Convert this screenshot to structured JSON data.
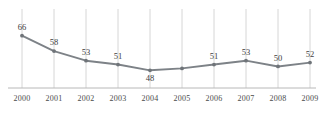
{
  "chart_data": {
    "type": "line",
    "title": "",
    "subtitle": "",
    "xlabel": "",
    "ylabel": "",
    "grid": "vertical",
    "legend": "none",
    "categories": [
      "2000",
      "2001",
      "2002",
      "2003",
      "2004",
      "2005",
      "2006",
      "2007",
      "2008",
      "2009"
    ],
    "values": [
      66,
      58,
      53,
      51,
      48,
      49,
      51,
      53,
      50,
      52
    ],
    "point_labels": [
      "66",
      "58",
      "53",
      "51",
      "48",
      "",
      "51",
      "53",
      "50",
      "52"
    ],
    "label_positions": [
      "above",
      "above",
      "above",
      "above",
      "below",
      "none",
      "above",
      "above",
      "above",
      "above"
    ],
    "ylim": [
      44,
      70
    ],
    "xlim": [
      "2000",
      "2009"
    ],
    "series": [
      {
        "name": "series-1",
        "values": [
          66,
          58,
          53,
          51,
          48,
          49,
          51,
          53,
          50,
          52
        ]
      }
    ],
    "annotations": []
  },
  "style": {
    "line_color": "#7d8287",
    "marker_color": "#6f7479",
    "gridline_color": "#d6d6d6",
    "axis_color": "#b8b8b8",
    "tick_text_color": "#4a4a4a",
    "value_text_color": "#3d3d3d",
    "background": "#ffffff"
  },
  "axis": {
    "tick_labels": [
      "2000",
      "2001",
      "2002",
      "2003",
      "2004",
      "2005",
      "2006",
      "2007",
      "2008",
      "2009"
    ]
  }
}
